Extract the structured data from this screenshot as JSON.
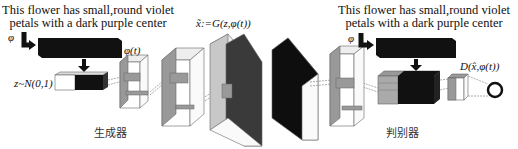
{
  "generator": {
    "caption_line1": "This flower has small,round violet",
    "caption_line2": "petals with a dark purple center",
    "phi_label": "φ",
    "embedding_label": "φ(t)",
    "noise_label": "z~N(0,1)",
    "output_label": "x̃:=G(z,φ(t))",
    "section_label": "生成器"
  },
  "discriminator": {
    "caption_line1": "This flower has small,round violet",
    "caption_line2": "petals with a dark purple center",
    "phi_label": "φ",
    "output_label": "D(x̂,φ(t))",
    "section_label": "判别器"
  },
  "colors": {
    "black_block": "#111111",
    "gray_face": "#9a9a9a",
    "light_face": "#f2f2f2",
    "line": "#555555"
  }
}
